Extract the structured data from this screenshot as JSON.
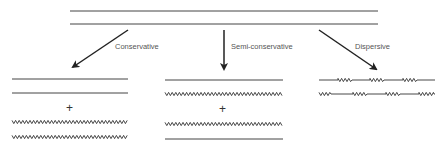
{
  "diagram": {
    "parent": {
      "strands": [
        "old",
        "old"
      ]
    },
    "models": [
      {
        "label": "Conservative",
        "molecules": [
          [
            "old",
            "old"
          ],
          [
            "new",
            "new"
          ]
        ],
        "separator": "+"
      },
      {
        "label": "Semi-conservative",
        "molecules": [
          [
            "old",
            "new"
          ],
          [
            "new",
            "old"
          ]
        ],
        "separator": "+"
      },
      {
        "label": "Dispersive",
        "molecules": [
          [
            "mixed",
            "mixed"
          ]
        ],
        "separator": ""
      }
    ],
    "legend": {
      "old": "straight line",
      "new": "zigzag line"
    },
    "colors": {
      "stroke": "#333333",
      "text": "#555555",
      "background": "#ffffff"
    }
  }
}
